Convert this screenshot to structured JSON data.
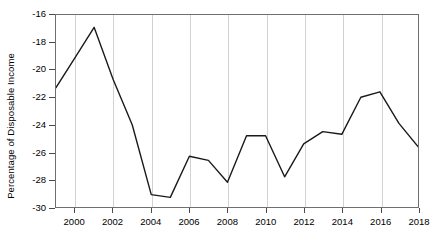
{
  "chart_data": {
    "type": "line",
    "title": "",
    "xlabel": "",
    "ylabel": "Percentage of Disposable Income",
    "xlim": [
      1999,
      2018
    ],
    "ylim": [
      -30,
      -16
    ],
    "grid": "vertical",
    "legend": "none",
    "line_color": "#1a1a1a",
    "x": [
      1999,
      2000,
      2001,
      2002,
      2003,
      2004,
      2005,
      2006,
      2007,
      2008,
      2009,
      2010,
      2011,
      2012,
      2013,
      2014,
      2015,
      2016,
      2017,
      2018
    ],
    "values": [
      -21.3,
      -19.1,
      -16.9,
      -20.7,
      -24.0,
      -29.1,
      -29.3,
      -26.3,
      -26.6,
      -28.2,
      -24.8,
      -24.8,
      -27.8,
      -25.4,
      -24.5,
      -24.7,
      -22.0,
      -21.6,
      -23.9,
      -25.6
    ],
    "series": [
      {
        "name": "Percentage of Disposable Income",
        "values": [
          -21.3,
          -19.1,
          -16.9,
          -20.7,
          -24.0,
          -29.1,
          -29.3,
          -26.3,
          -26.6,
          -28.2,
          -24.8,
          -24.8,
          -27.8,
          -25.4,
          -24.5,
          -24.7,
          -22.0,
          -21.6,
          -23.9,
          -25.6
        ]
      }
    ],
    "y_ticks": [
      -16,
      -18,
      -20,
      -22,
      -24,
      -26,
      -28,
      -30
    ],
    "y_tick_labels": [
      "-16",
      "-18",
      "-20",
      "-22",
      "-24",
      "-26",
      "-28",
      "-30"
    ],
    "x_ticks": [
      2000,
      2002,
      2004,
      2006,
      2008,
      2010,
      2012,
      2014,
      2016,
      2018
    ],
    "x_tick_labels": [
      "2000",
      "2002",
      "2004",
      "2006",
      "2008",
      "2010",
      "2012",
      "2014",
      "2016",
      "2018"
    ]
  }
}
